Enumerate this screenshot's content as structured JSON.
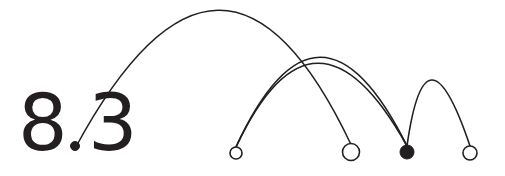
{
  "figure": {
    "title": "8.3",
    "background_color": "#ffffff",
    "stroke_color": "#231f20",
    "width": 505,
    "height": 176
  },
  "labels": [
    {
      "name": "digit-eight",
      "text": "8",
      "x": 18,
      "y": 150,
      "font_size": 78
    },
    {
      "name": "digit-three",
      "text": "3",
      "x": 88,
      "y": 150,
      "font_size": 78
    }
  ],
  "chart_data": {
    "type": "arc-diagram",
    "title": "8.3",
    "xlabel": "",
    "ylabel": "",
    "grid": false,
    "legend": null,
    "baseline_y": 152,
    "nodes": [
      {
        "id": "n1",
        "label": "",
        "x": 75,
        "y": 146,
        "radius": 4.5,
        "filled": true
      },
      {
        "id": "n2",
        "label": "",
        "x": 236,
        "y": 153,
        "radius": 6.0,
        "filled": false
      },
      {
        "id": "n3",
        "label": "",
        "x": 351,
        "y": 152,
        "radius": 8.5,
        "filled": false
      },
      {
        "id": "n4",
        "label": "",
        "x": 407,
        "y": 152,
        "radius": 7.0,
        "filled": true
      },
      {
        "id": "n5",
        "label": "",
        "x": 470,
        "y": 153,
        "radius": 7.0,
        "filled": false
      }
    ],
    "edges": [
      {
        "id": "e1",
        "source": "n1",
        "target": "n3",
        "apex_x": 218,
        "apex_y": 13,
        "stroke_width": 1.5
      },
      {
        "id": "e2",
        "source": "n2",
        "target": "n4",
        "apex_x": 320,
        "apex_y": 60,
        "stroke_width": 1.7
      },
      {
        "id": "e3",
        "source": "n2",
        "target": "n4",
        "apex_x": 318,
        "apex_y": 66,
        "stroke_width": 1.7
      },
      {
        "id": "e4",
        "source": "n4",
        "target": "n5",
        "apex_x": 432,
        "apex_y": 83,
        "stroke_width": 1.6
      }
    ]
  }
}
